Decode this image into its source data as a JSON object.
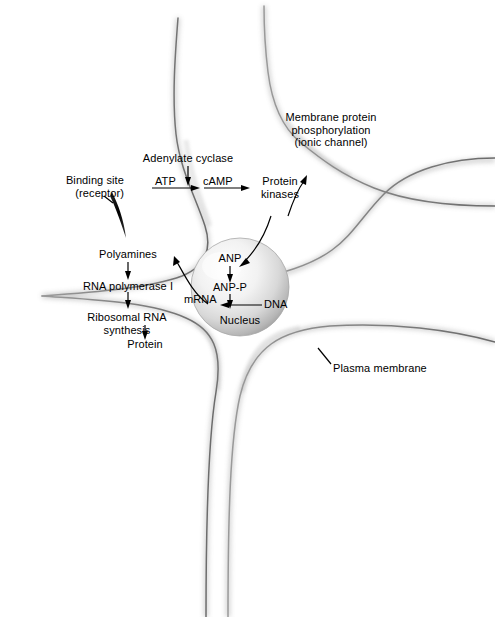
{
  "figure": {
    "type": "cell-signaling-diagram",
    "background_color": "#ffffff",
    "ink_color": "#000000",
    "membrane_color": "#808080"
  },
  "labels": {
    "binding_site_line1": "Binding site",
    "binding_site_line2": "(receptor)",
    "adenylate_cyclase": "Adenylate cyclase",
    "atp": "ATP",
    "camp": "cAMP",
    "protein_kinases_line1": "Protein",
    "protein_kinases_line2": "kinases",
    "membrane_protein_line1": "Membrane protein",
    "membrane_protein_line2": "phosphorylation",
    "membrane_protein_line3": "(ionic channel)",
    "polyamines": "Polyamines",
    "rna_polymerase": "RNA polymerase I",
    "ribosomal_rna_line1": "Ribosomal RNA",
    "ribosomal_rna_line2": "synthesis",
    "protein": "Protein",
    "anp": "ANP",
    "anp_p": "ANP-P",
    "mrna": "mRNA",
    "dna": "DNA",
    "nucleus": "Nucleus",
    "plasma_membrane": "Plasma membrane"
  },
  "pathways": {
    "membrane_cascade": [
      "ATP",
      "cAMP",
      "Protein kinases"
    ],
    "kinase_targets": [
      "Membrane protein phosphorylation (ionic channel)",
      "ANP"
    ],
    "nuclear_cascade": [
      "ANP",
      "ANP-P",
      "mRNA"
    ],
    "transcription": [
      "DNA",
      "mRNA"
    ],
    "cytoplasmic_cascade": [
      "Polyamines",
      "RNA polymerase I",
      "Ribosomal RNA synthesis",
      "Protein"
    ],
    "enzyme": "Adenylate cyclase"
  },
  "organelles": {
    "nucleus_label": "Nucleus",
    "membrane_label": "Plasma membrane",
    "receptor_label": "Binding site (receptor)"
  }
}
